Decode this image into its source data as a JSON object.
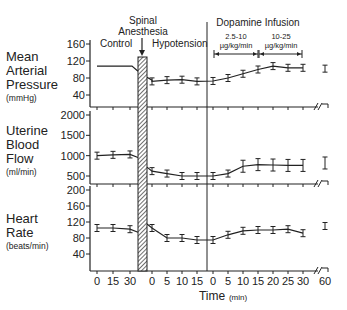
{
  "chart_data": [
    {
      "type": "line",
      "panel": "mean-arterial-pressure",
      "ylabel": [
        "Mean",
        "Arterial",
        "Pressure"
      ],
      "yunit": "(mmHg)",
      "yticks": [
        160,
        120,
        80,
        40
      ],
      "ylim": [
        0,
        170
      ],
      "x": [
        "0",
        "15",
        "30",
        "0",
        "5",
        "10",
        "15",
        "0",
        "5",
        "10",
        "15",
        "20",
        "25",
        "30",
        "60"
      ],
      "values": [
        null,
        null,
        null,
        72,
        75,
        76,
        72,
        73,
        80,
        90,
        100,
        108,
        104,
        104,
        102
      ],
      "control_line": [
        108,
        108,
        104
      ],
      "errorbars": true
    },
    {
      "type": "line",
      "panel": "uterine-blood-flow",
      "ylabel": [
        "Uterine",
        "Blood",
        "Flow"
      ],
      "yunit": "(ml/min)",
      "yticks": [
        2000,
        1500,
        1000,
        500
      ],
      "ylim": [
        0,
        2100
      ],
      "x": [
        "0",
        "15",
        "30",
        "0",
        "5",
        "10",
        "15",
        "0",
        "5",
        "10",
        "15",
        "20",
        "25",
        "30",
        "60"
      ],
      "values": [
        1000,
        1020,
        1030,
        620,
        560,
        500,
        500,
        500,
        560,
        740,
        780,
        770,
        760,
        760,
        820
      ],
      "errorbars": true
    },
    {
      "type": "line",
      "panel": "heart-rate",
      "ylabel": [
        "Heart",
        "Rate"
      ],
      "yunit": "(beats/min)",
      "yticks": [
        200,
        160,
        120,
        80,
        40
      ],
      "ylim": [
        0,
        210
      ],
      "x": [
        "0",
        "15",
        "30",
        "0",
        "5",
        "10",
        "15",
        "0",
        "5",
        "10",
        "15",
        "20",
        "25",
        "30",
        "60"
      ],
      "values": [
        105,
        105,
        102,
        105,
        80,
        80,
        75,
        75,
        88,
        98,
        100,
        100,
        102,
        92,
        110
      ],
      "errorbars": true
    }
  ],
  "annotations": {
    "spinal_anesthesia": [
      "Spinal",
      "Anesthesia"
    ],
    "control": "Control",
    "hypotension": "Hypotension",
    "dopamine": "Dopamine Infusion",
    "dose1": [
      "2.5-10",
      "µg/kg/min"
    ],
    "dose2": [
      "10-25",
      "µg/kg/min"
    ]
  },
  "xaxis": {
    "title": "Time",
    "unit": "(min)",
    "ticks": [
      "0",
      "15",
      "30",
      "0",
      "5",
      "10",
      "15",
      "0",
      "5",
      "10",
      "15",
      "20",
      "25",
      "30",
      "60"
    ]
  }
}
